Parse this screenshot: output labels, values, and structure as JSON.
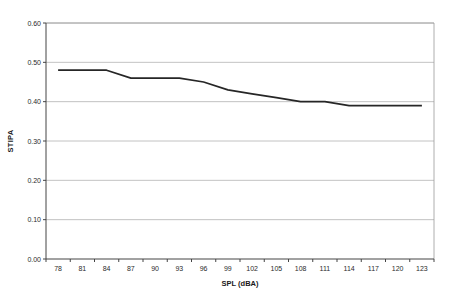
{
  "chart_data": {
    "type": "line",
    "title": "",
    "xlabel": "SPL (dBA)",
    "ylabel": "STIPA",
    "categories": [
      "78",
      "81",
      "84",
      "87",
      "90",
      "93",
      "96",
      "99",
      "102",
      "105",
      "108",
      "111",
      "114",
      "117",
      "120",
      "123"
    ],
    "values": [
      0.48,
      0.48,
      0.48,
      0.46,
      0.46,
      0.46,
      0.45,
      0.43,
      0.42,
      0.41,
      0.4,
      0.4,
      0.39,
      0.39,
      0.39,
      0.39
    ],
    "ylim": [
      0.0,
      0.6
    ],
    "y_tick_step": 0.1,
    "y_tick_labels": [
      "0.00",
      "0.10",
      "0.20",
      "0.30",
      "0.40",
      "0.50",
      "0.60"
    ],
    "grid": "horizontal",
    "legend": "none",
    "colors": {
      "line": "#262626",
      "gridline": "#b3b3b3",
      "frame": "#999999",
      "axis": "#444444",
      "background": "#ffffff",
      "tick_text": "#2b2b2b"
    }
  }
}
